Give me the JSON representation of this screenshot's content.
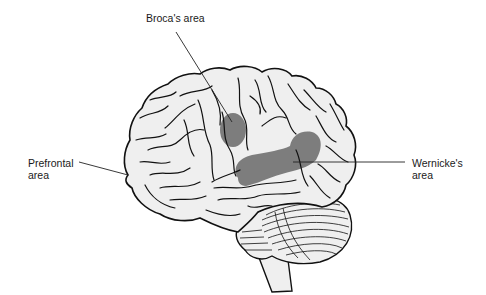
{
  "figure": {
    "type": "brain-lateral-view",
    "colors": {
      "background": "#ffffff",
      "brain_fill": "#efefef",
      "outline": "#111111",
      "highlight": "#767676",
      "leader_line": "#222222"
    }
  },
  "labels": {
    "broca": {
      "text": "Broca's area"
    },
    "prefrontal": {
      "line1": "Prefrontal",
      "line2": "area"
    },
    "wernicke": {
      "line1": "Wernicke's",
      "line2": "area"
    }
  },
  "regions": [
    {
      "name": "Broca's area",
      "highlighted": true
    },
    {
      "name": "Wernicke's area",
      "highlighted": true
    },
    {
      "name": "Prefrontal area",
      "highlighted": false
    }
  ]
}
